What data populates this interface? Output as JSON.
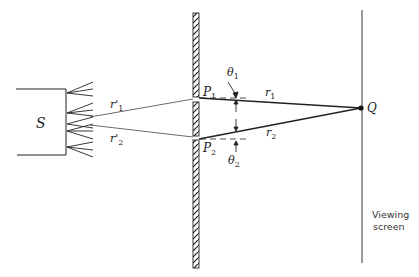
{
  "diagram": {
    "source": {
      "label": "S"
    },
    "slits": [
      {
        "label": "P",
        "subscript": "1"
      },
      {
        "label": "P",
        "subscript": "2"
      }
    ],
    "paths_to_slits": [
      {
        "label": "r'",
        "subscript": "1"
      },
      {
        "label": "r'",
        "subscript": "2"
      }
    ],
    "paths_to_screen": [
      {
        "label": "r",
        "subscript": "1"
      },
      {
        "label": "r",
        "subscript": "2"
      }
    ],
    "angles": [
      {
        "label": "θ",
        "subscript": "1"
      },
      {
        "label": "θ",
        "subscript": "2"
      }
    ],
    "point": {
      "label": "Q"
    },
    "screen": {
      "label_line1": "Viewing",
      "label_line2": "screen"
    },
    "colors": {
      "ink": "#222222",
      "screen_line": "#555555",
      "background": "#ffffff"
    }
  }
}
